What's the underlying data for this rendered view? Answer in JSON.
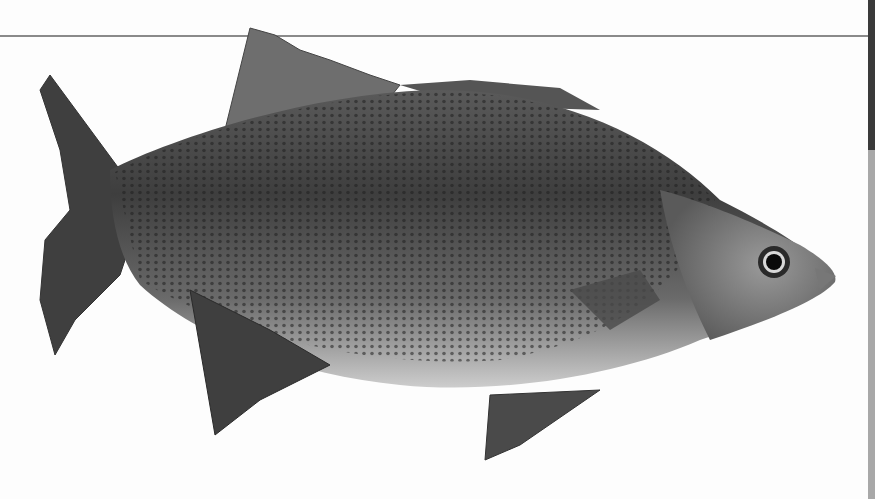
{
  "image": {
    "subject": "fish",
    "description": "Grayscale photograph of a white perch / bass-like fish with horizontal rows of dark spots, facing right, on a white background",
    "palette": {
      "background": "#fdfdfd",
      "rule_line": "#8a8a8a",
      "edge_dark": "#3a3a3a",
      "edge_light": "#a8a8a8",
      "body_dark": "#3c3c3c",
      "body_mid": "#7a7a7a",
      "belly": "#cfcfcf",
      "fin": "#4a4a4a"
    }
  }
}
